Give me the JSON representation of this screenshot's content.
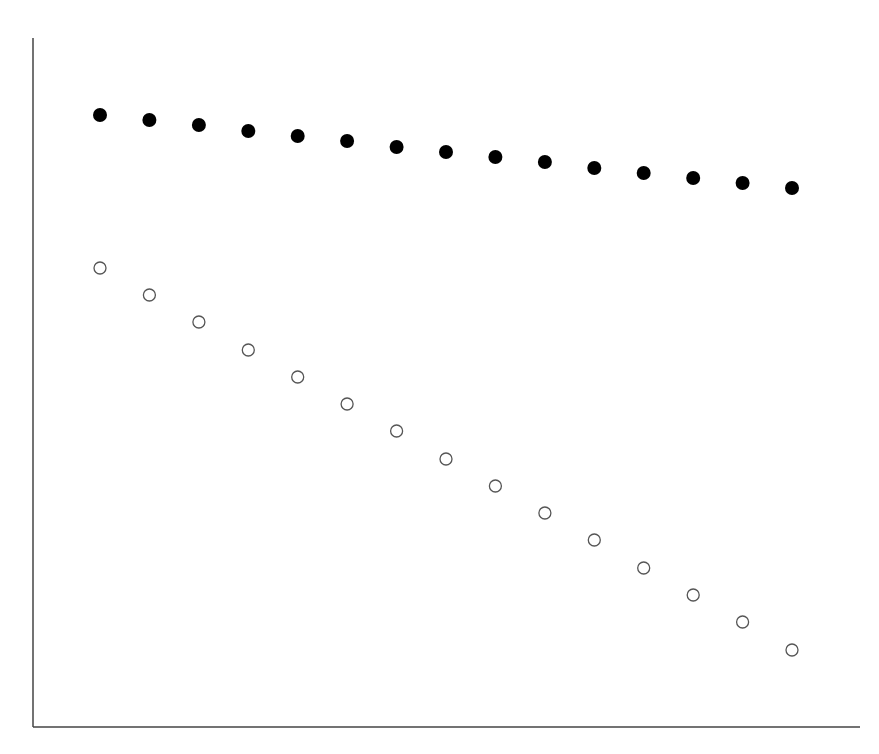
{
  "chart_data": {
    "type": "scatter",
    "title": "",
    "xlabel": "",
    "ylabel": "",
    "grid": false,
    "legend": null,
    "x": [
      1,
      2,
      3,
      4,
      5,
      6,
      7,
      8,
      9,
      10,
      11,
      12,
      13,
      14,
      15
    ],
    "xlim": [
      0,
      16.3
    ],
    "ylim": [
      0,
      689
    ],
    "series": [
      {
        "name": "filled",
        "marker": "filled-circle",
        "color": "#000000",
        "values": [
          612,
          607,
          602,
          596,
          591,
          586,
          580,
          575,
          570,
          565,
          559,
          554,
          549,
          544,
          539
        ]
      },
      {
        "name": "open",
        "marker": "open-circle",
        "color": "#555555",
        "values": [
          459,
          432,
          405,
          377,
          350,
          323,
          296,
          268,
          241,
          214,
          187,
          159,
          132,
          105,
          77
        ]
      }
    ]
  },
  "layout": {
    "axis_color": "#444444",
    "origin_px": [
      33,
      727
    ],
    "x_axis_end_px": 860,
    "y_axis_top_px": 38,
    "x_start_px": 100,
    "x_step_px": 49.43
  }
}
